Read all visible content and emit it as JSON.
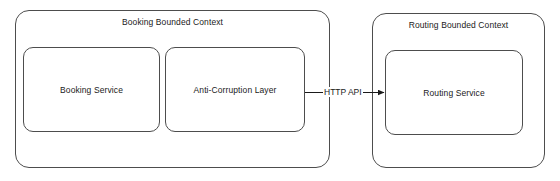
{
  "diagram": {
    "background_color": "#ffffff",
    "stroke_color": "#4d4d4d",
    "text_color": "#1a1a1a"
  },
  "contexts": [
    {
      "id": "booking-bounded-context",
      "label": "Booking Bounded Context",
      "services": [
        {
          "id": "booking-service",
          "label": "Booking Service"
        },
        {
          "id": "anti-corruption-layer",
          "label": "Anti-Corruption Layer"
        }
      ]
    },
    {
      "id": "routing-bounded-context",
      "label": "Routing Bounded Context",
      "services": [
        {
          "id": "routing-service",
          "label": "Routing Service"
        }
      ]
    }
  ],
  "connections": [
    {
      "id": "acl-to-routing",
      "label": "HTTP API",
      "from": "anti-corruption-layer",
      "to": "routing-service",
      "arrow": "single"
    }
  ]
}
